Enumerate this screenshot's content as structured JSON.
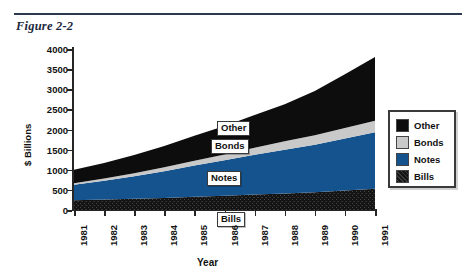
{
  "figure": {
    "title": "Figure 2-2"
  },
  "legend": {
    "position": "right",
    "items": [
      {
        "label": "Other",
        "color": "#0d0d0d",
        "fill": "solid"
      },
      {
        "label": "Bonds",
        "color": "#c9c9c9",
        "fill": "solid"
      },
      {
        "label": "Notes",
        "color": "#15538f",
        "fill": "solid"
      },
      {
        "label": "Bills",
        "color": "#1a1a1a",
        "fill": "textured"
      }
    ]
  },
  "callouts": [
    {
      "label": "Other",
      "x": 143,
      "y": 72
    },
    {
      "label": "Bonds",
      "x": 137,
      "y": 90
    },
    {
      "label": "Notes",
      "x": 133,
      "y": 122
    },
    {
      "label": "Bills",
      "x": 143,
      "y": 163
    }
  ],
  "chart_data": {
    "type": "area",
    "stacked": true,
    "title": "Figure 2-2",
    "xlabel": "Year",
    "ylabel": "$ Billions",
    "ylim": [
      0,
      4000
    ],
    "ytick_step": 500,
    "yticks": [
      0,
      500,
      1000,
      1500,
      2000,
      2500,
      3000,
      3500,
      4000
    ],
    "ytick_labels": [
      "0",
      "500",
      "1000",
      "1500",
      "2000",
      "2500",
      "3000",
      "3500",
      "4000"
    ],
    "grid": false,
    "categories": [
      1981,
      1982,
      1983,
      1984,
      1985,
      1986,
      1987,
      1988,
      1989,
      1990,
      1991
    ],
    "xtick_labels": [
      "1981",
      "1982",
      "1983",
      "1984",
      "1985",
      "1986",
      "1987",
      "1988",
      "1989",
      "1990",
      "1991"
    ],
    "series": [
      {
        "name": "Bills",
        "color": "#1a1a1a",
        "values": [
          245,
          260,
          280,
          300,
          330,
          355,
          385,
          410,
          440,
          485,
          530
        ]
      },
      {
        "name": "Notes",
        "color": "#15538f",
        "values": [
          380,
          465,
          560,
          665,
          775,
          880,
          985,
          1090,
          1180,
          1290,
          1400
        ]
      },
      {
        "name": "Bonds",
        "color": "#c9c9c9",
        "values": [
          40,
          55,
          75,
          95,
          120,
          145,
          175,
          205,
          235,
          265,
          290
        ]
      },
      {
        "name": "Other",
        "color": "#0d0d0d",
        "values": [
          335,
          385,
          450,
          530,
          620,
          710,
          815,
          925,
          1100,
          1330,
          1580
        ]
      }
    ],
    "totals": [
      1000,
      1165,
      1365,
      1590,
      1845,
      2090,
      2360,
      2630,
      2955,
      3370,
      3800
    ]
  }
}
